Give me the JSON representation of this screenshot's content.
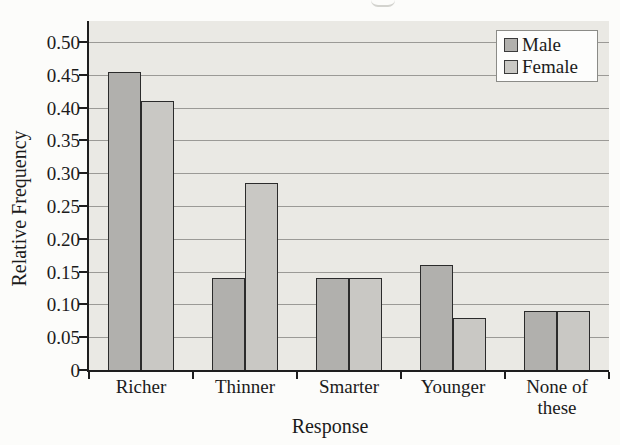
{
  "chart_data": {
    "type": "bar",
    "title": "",
    "xlabel": "Response",
    "ylabel": "Relative Frequency",
    "categories": [
      "Richer",
      "Thinner",
      "Smarter",
      "Younger",
      "None of these"
    ],
    "series": [
      {
        "name": "Male",
        "color": "#b1b0ad",
        "values": [
          0.455,
          0.14,
          0.14,
          0.16,
          0.09
        ]
      },
      {
        "name": "Female",
        "color": "#c9c8c4",
        "values": [
          0.41,
          0.285,
          0.14,
          0.08,
          0.09
        ]
      }
    ],
    "ylim": [
      0,
      0.52
    ],
    "yticks": [
      0,
      0.05,
      0.1,
      0.15,
      0.2,
      0.25,
      0.3,
      0.35,
      0.4,
      0.45,
      0.5
    ],
    "ytick_labels": [
      "0",
      "0.05",
      "0.10",
      "0.15",
      "0.20",
      "0.25",
      "0.30",
      "0.35",
      "0.40",
      "0.45",
      "0.50"
    ],
    "grid": true,
    "legend_position": "top-right",
    "plot_bg": "#eae9e4",
    "gridline_color": "#9b9a96",
    "axis_color": "#1e1e1e",
    "bar_border_color": "#2b2b2b"
  }
}
